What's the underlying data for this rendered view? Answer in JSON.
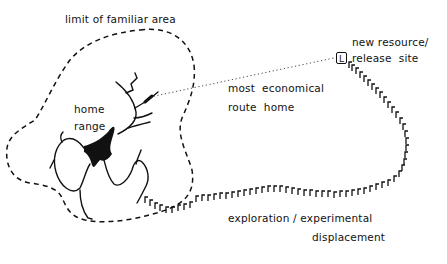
{
  "diagram": {
    "type": "homing-behaviour-schematic",
    "colors": {
      "ink": "#111111",
      "background": "#ffffff"
    },
    "labels": {
      "familiar_area": "limit of familiar area",
      "home_range_line1": "home",
      "home_range_line2": "range",
      "economical_line1": "most  economical",
      "economical_line2": "route  home",
      "resource_line1": "new resource/",
      "resource_line2": "release  site",
      "exploration_line1": "exploration / experimental",
      "exploration_line2": "displacement"
    },
    "release_marker": {
      "glyph": "L",
      "shape": "boxed-letter"
    },
    "elements": [
      {
        "id": "familiar-area-boundary",
        "style": "dashed",
        "label": "limit of familiar area"
      },
      {
        "id": "home-range",
        "style": "solid-branching-paths",
        "label": "home range"
      },
      {
        "id": "economical-route",
        "style": "dotted",
        "from": "home range",
        "to": "new resource/release site"
      },
      {
        "id": "exploration-path",
        "style": "hooked-track",
        "from": "home range",
        "to": "new resource/release site"
      }
    ]
  }
}
